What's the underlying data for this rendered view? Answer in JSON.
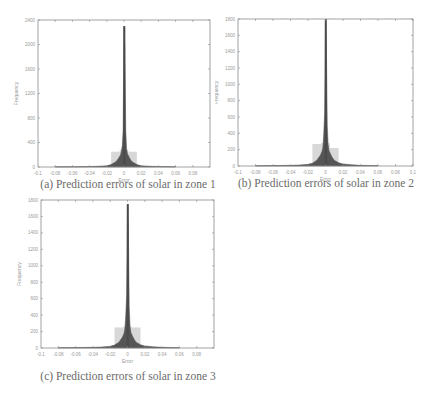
{
  "chart_data": [
    {
      "type": "bar",
      "id": "a",
      "caption": "(a) Prediction errors of solar in zone 1",
      "xlabel": "Error",
      "ylabel": "Frequency",
      "xlim": [
        -0.1,
        0.1
      ],
      "ylim": [
        0,
        2400
      ],
      "xticks": [
        "-0.08",
        "-0.06",
        "-0.04",
        "-0.02",
        "0",
        "0.02",
        "0.04",
        "0.06",
        "0.08"
      ],
      "xtick_values": [
        -0.08,
        -0.06,
        -0.04,
        -0.02,
        0,
        0.02,
        0.04,
        0.06,
        0.08
      ],
      "yticks": [
        "0",
        "400",
        "800",
        "1200",
        "1600",
        "2000",
        "2400"
      ],
      "ytick_values": [
        0,
        400,
        800,
        1200,
        1600,
        2000,
        2400
      ],
      "grid": false,
      "bins": {
        "x": [
          -0.02,
          -0.015,
          -0.01,
          -0.008,
          -0.006,
          -0.004,
          -0.003,
          -0.002,
          -0.001,
          0,
          0.001,
          0.002,
          0.003,
          0.004,
          0.006,
          0.008,
          0.01,
          0.015,
          0.02,
          0.03,
          0.04,
          0.06
        ],
        "values": [
          20,
          40,
          80,
          110,
          150,
          200,
          260,
          350,
          600,
          2300,
          1950,
          600,
          300,
          220,
          160,
          110,
          80,
          40,
          20,
          12,
          8,
          4
        ]
      },
      "background_bins": {
        "x": [
          -0.01,
          0,
          0.01
        ],
        "values": [
          250,
          280,
          250
        ]
      }
    },
    {
      "type": "bar",
      "id": "b",
      "caption": "(b) Prediction errors of solar in zone 2",
      "xlabel": "Error",
      "ylabel": "Frequency",
      "xlim": [
        -0.1,
        0.1
      ],
      "ylim": [
        0,
        1800
      ],
      "xticks": [
        "-0.08",
        "-0.06",
        "-0.04",
        "-0.02",
        "0",
        "0.02",
        "0.04",
        "0.06",
        "0.08",
        "0.1"
      ],
      "xtick_values": [
        -0.08,
        -0.06,
        -0.04,
        -0.02,
        0,
        0.02,
        0.04,
        0.06,
        0.08,
        0.1
      ],
      "yticks": [
        "0",
        "200",
        "400",
        "600",
        "800",
        "1000",
        "1200",
        "1400",
        "1600",
        "1800"
      ],
      "ytick_values": [
        0,
        200,
        400,
        600,
        800,
        1000,
        1200,
        1400,
        1600,
        1800
      ],
      "grid": false,
      "bins": {
        "x": [
          -0.02,
          -0.015,
          -0.01,
          -0.008,
          -0.006,
          -0.004,
          -0.003,
          -0.002,
          -0.001,
          0,
          0.001,
          0.002,
          0.003,
          0.004,
          0.006,
          0.008,
          0.01,
          0.015,
          0.02,
          0.03,
          0.04,
          0.06
        ],
        "values": [
          20,
          35,
          70,
          100,
          130,
          180,
          230,
          400,
          650,
          1800,
          1450,
          500,
          260,
          190,
          140,
          100,
          70,
          40,
          25,
          15,
          8,
          4
        ]
      },
      "background_bins": {
        "x": [
          -0.01,
          0,
          0.01
        ],
        "values": [
          270,
          280,
          220
        ]
      }
    },
    {
      "type": "bar",
      "id": "c",
      "caption": "(c) Prediction errors of solar in zone 3",
      "xlabel": "Error",
      "ylabel": "Frequency",
      "xlim": [
        -0.1,
        0.1
      ],
      "ylim": [
        0,
        1800
      ],
      "xticks": [
        "-0.08",
        "-0.06",
        "-0.04",
        "-0.02",
        "0",
        "0.02",
        "0.04",
        "0.06",
        "0.08"
      ],
      "xtick_values": [
        -0.08,
        -0.06,
        -0.04,
        -0.02,
        0,
        0.02,
        0.04,
        0.06,
        0.08
      ],
      "yticks": [
        "0",
        "200",
        "400",
        "600",
        "800",
        "1000",
        "1200",
        "1400",
        "1600",
        "1800"
      ],
      "ytick_values": [
        0,
        200,
        400,
        600,
        800,
        1000,
        1200,
        1400,
        1600,
        1800
      ],
      "grid": false,
      "bins": {
        "x": [
          -0.02,
          -0.015,
          -0.01,
          -0.008,
          -0.006,
          -0.004,
          -0.003,
          -0.002,
          -0.001,
          0,
          0.001,
          0.002,
          0.003,
          0.004,
          0.006,
          0.008,
          0.01,
          0.015,
          0.02,
          0.03,
          0.04,
          0.06
        ],
        "values": [
          20,
          35,
          70,
          100,
          130,
          180,
          240,
          400,
          650,
          1750,
          1450,
          500,
          260,
          190,
          140,
          100,
          70,
          40,
          25,
          15,
          8,
          4
        ]
      },
      "background_bins": {
        "x": [
          -0.01,
          0,
          0.01
        ],
        "values": [
          250,
          260,
          250
        ]
      }
    }
  ],
  "colors": {
    "bar": "#555555",
    "background_bar": "#d8d8d8",
    "axis": "#8a8a8a",
    "text": "#9a9a9a",
    "caption": "#6a6a6a"
  }
}
